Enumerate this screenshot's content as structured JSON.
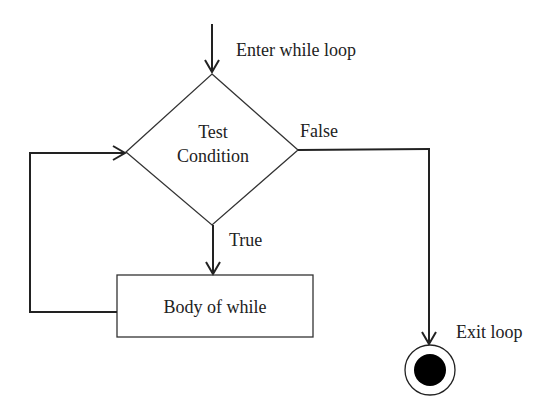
{
  "diagram": {
    "type": "flowchart",
    "labels": {
      "entry": "Enter while loop",
      "decision_line1": "Test",
      "decision_line2": "Condition",
      "false_branch": "False",
      "true_branch": "True",
      "body": "Body of while",
      "exit": "Exit loop"
    },
    "nodes": [
      {
        "id": "decision",
        "shape": "diamond",
        "text": "Test Condition"
      },
      {
        "id": "body",
        "shape": "rectangle",
        "text": "Body of while"
      },
      {
        "id": "end",
        "shape": "final-state",
        "text": "Exit loop"
      }
    ],
    "edges": [
      {
        "from": "entry",
        "to": "decision",
        "label": "Enter while loop"
      },
      {
        "from": "decision",
        "to": "body",
        "label": "True"
      },
      {
        "from": "decision",
        "to": "end",
        "label": "False"
      },
      {
        "from": "body",
        "to": "decision",
        "label": ""
      }
    ],
    "colors": {
      "stroke": "#222222",
      "background": "#ffffff",
      "end_fill": "#000000"
    }
  }
}
